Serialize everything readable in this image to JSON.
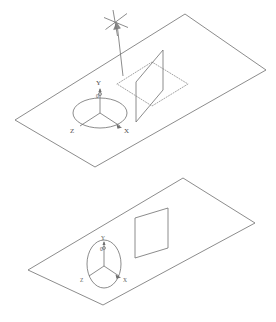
{
  "image": {
    "title": "Isometric plane with coordinate triad and square patch",
    "width": 276,
    "height": 322,
    "background_color": "#ffffff",
    "line_color": "#6e6e6e",
    "dotted_color": "#9a9a9a",
    "label_color": "#4a4a4a"
  },
  "figures": [
    {
      "id": "top-figure",
      "name": "rotated-configuration",
      "ground_plane": {
        "name": "ground-plane-parallelogram",
        "points": "185,14 266,70 95,167 15,120",
        "stroke": "#6e6e6e"
      },
      "triad": {
        "name": "coordinate-triad-top",
        "ellipse": {
          "cx": 100,
          "cy": 113,
          "rx": 27,
          "ry": 15
        },
        "origin": {
          "x": 100,
          "y": 113
        },
        "axes": [
          {
            "label": "Y",
            "tip_x": 100,
            "tip_y": 88,
            "label_x": 97,
            "label_y": 84
          },
          {
            "label": "X",
            "tip_x": 121,
            "tip_y": 126,
            "label_x": 124,
            "label_y": 132
          },
          {
            "label": "Z",
            "tip_x": 79,
            "tip_y": 126,
            "label_x": 71,
            "label_y": 132
          }
        ],
        "origin_label": "0",
        "origin_label_x": 97,
        "origin_label_y": 95
      },
      "solid_square": {
        "name": "tilted-square-patch",
        "points": "136,122 136,82 163,50 163,90",
        "stroke": "#6e6e6e"
      },
      "dotted_square": {
        "name": "projected-square-outline",
        "points": "117,84 152,62 188,84 152,106",
        "stroke": "#9a9a9a"
      },
      "rotation_indicator": {
        "name": "rotation-arrow",
        "arrow_path": "M 123,76 L 117,26",
        "cross_center": {
          "x": 115,
          "y": 22
        },
        "cross_arms": [
          "M 104,17 L 127,27",
          "M 113,11 L 117,35",
          "M 106,29 L 126,14"
        ]
      }
    },
    {
      "id": "bottom-figure",
      "name": "reference-configuration",
      "ground_plane": {
        "name": "ground-plane-parallelogram",
        "points": "183,178 255,223 103,305 28,270",
        "stroke": "#6e6e6e"
      },
      "triad": {
        "name": "coordinate-triad-bottom",
        "ellipse": {
          "cx": 104,
          "cy": 264,
          "rx": 17,
          "ry": 24
        },
        "origin": {
          "x": 104,
          "y": 266
        },
        "axes": [
          {
            "label": "Y",
            "tip_x": 104,
            "tip_y": 240,
            "label_x": 101,
            "label_y": 238
          },
          {
            "label": "X",
            "tip_x": 120,
            "tip_y": 275,
            "label_x": 123,
            "label_y": 281
          },
          {
            "label": "Z",
            "tip_x": 88,
            "tip_y": 275,
            "label_x": 81,
            "label_y": 281
          }
        ],
        "origin_label": "0",
        "origin_label_x": 101,
        "origin_label_y": 249
      },
      "solid_square": {
        "name": "square-patch",
        "points": "135,258 135,218 168,208 168,248",
        "stroke": "#6e6e6e"
      }
    }
  ]
}
